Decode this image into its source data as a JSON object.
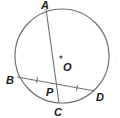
{
  "diagram": {
    "type": "circle-geometry",
    "colors": {
      "stroke": "#707070",
      "label": "#1a1a1a",
      "center_dot": "#555555",
      "background": "#ffffff"
    },
    "circle": {
      "center_label": "O",
      "cx": 62,
      "cy": 56,
      "r": 47
    },
    "points": {
      "A": {
        "label": "A",
        "x": 46,
        "y": 9
      },
      "B": {
        "label": "B",
        "x": 17,
        "y": 77
      },
      "C": {
        "label": "C",
        "x": 59,
        "y": 103
      },
      "D": {
        "label": "D",
        "x": 95,
        "y": 91
      },
      "P": {
        "label": "P",
        "x": 56,
        "y": 85
      },
      "O": {
        "label": "O",
        "x": 61,
        "y": 57
      }
    },
    "segments": [
      {
        "name": "chord-AC",
        "from": "A",
        "to": "C"
      },
      {
        "name": "chord-BD",
        "from": "B",
        "to": "D",
        "congruence_marks": "BP = PD"
      }
    ]
  }
}
